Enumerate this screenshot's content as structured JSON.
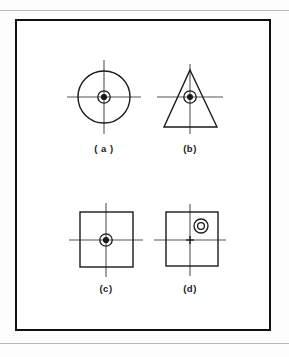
{
  "figure": {
    "title": "",
    "panels": [
      {
        "id": "a",
        "label": "( a )",
        "shape": "circle",
        "shape_name": "circle-outline",
        "marker": "concentric-dot",
        "marker_offset": "centered",
        "geometry": {
          "cx": 87,
          "cy": 76,
          "r": 26
        },
        "crosshair": {
          "cx": 87,
          "cy": 76,
          "half_length": 37
        },
        "label_pos": {
          "x": 87,
          "y": 128
        }
      },
      {
        "id": "b",
        "label": "(b)",
        "shape": "triangle",
        "shape_name": "triangle-outline",
        "marker": "concentric-dot",
        "marker_offset": "centered",
        "geometry": {
          "apex_x": 173,
          "apex_y": 49,
          "base_left_x": 147,
          "base_right_x": 200,
          "base_y": 106
        },
        "crosshair": {
          "cx": 173,
          "cy": 76,
          "half_length": 33
        },
        "label_pos": {
          "x": 173,
          "y": 128
        }
      },
      {
        "id": "c",
        "label": "(c)",
        "shape": "square",
        "shape_name": "square-outline",
        "marker": "concentric-dot",
        "marker_offset": "centered",
        "geometry": {
          "x": 63,
          "y": 191,
          "w": 53,
          "h": 55
        },
        "crosshair": {
          "cx": 89,
          "cy": 219,
          "half_length": 37
        },
        "label_pos": {
          "x": 89,
          "y": 268
        }
      },
      {
        "id": "d",
        "label": "(d)",
        "shape": "square",
        "shape_name": "square-outline",
        "marker": "concentric-ring",
        "marker_offset": "upper-right",
        "geometry": {
          "x": 149,
          "y": 191,
          "w": 52,
          "h": 54
        },
        "crosshair": {
          "cx": 173,
          "cy": 219,
          "half_length": 36
        },
        "center_mark": "plus",
        "marker_pos": {
          "cx": 184,
          "cy": 205
        },
        "label_pos": {
          "x": 173,
          "y": 268
        }
      }
    ],
    "colors": {
      "ink": "#1a1a1a",
      "crosshair": "#555555",
      "frame": "#111111",
      "rule": "#b9b9b9",
      "paper": "#ffffff"
    }
  }
}
